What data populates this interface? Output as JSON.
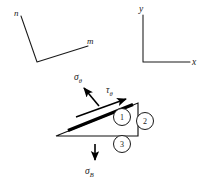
{
  "figure": {
    "background_color": "#ffffff",
    "line_color": "#1a1a1a",
    "width": 202,
    "height": 180
  },
  "angle_marker": {
    "name": "n-m angle marker",
    "label_n": "n",
    "label_m": "m",
    "vertices": [
      {
        "x": 21,
        "y": 16
      },
      {
        "x": 37,
        "y": 62
      },
      {
        "x": 88,
        "y": 46
      }
    ],
    "label_n_pos": {
      "x": 14,
      "y": 14
    },
    "label_m_pos": {
      "x": 88,
      "y": 44
    }
  },
  "axes": {
    "name": "xy coordinate axes",
    "label_y": "y",
    "label_x": "x",
    "origin": {
      "x": 143,
      "y": 62
    },
    "y_top": {
      "x": 143,
      "y": 15
    },
    "x_right": {
      "x": 190,
      "y": 62
    },
    "label_y_pos": {
      "x": 140,
      "y": 12
    },
    "label_x_pos": {
      "x": 193,
      "y": 65
    }
  },
  "wedge": {
    "name": "triangular wedge element",
    "apex_left": {
      "x": 56,
      "y": 136
    },
    "top_right": {
      "x": 138,
      "y": 103
    },
    "bottom_right": {
      "x": 138,
      "y": 136
    },
    "bold_face": {
      "x1": 68,
      "y1": 130,
      "x2": 133,
      "y2": 105
    }
  },
  "stresses": {
    "sigma_theta": {
      "symbol": "σ",
      "subscript": "θ",
      "label": "σθ",
      "label_pos": {
        "x": 78,
        "y": 78
      },
      "arrow_from": {
        "x": 99,
        "y": 105
      },
      "arrow_to": {
        "x": 83,
        "y": 86
      }
    },
    "tau_theta": {
      "symbol": "τ",
      "subscript": "θ",
      "label": "τθ",
      "label_pos": {
        "x": 110,
        "y": 93
      },
      "arrow_from": {
        "x": 75,
        "y": 117
      },
      "arrow_to": {
        "x": 127,
        "y": 98
      }
    },
    "sigma_B": {
      "symbol": "σ",
      "subscript": "B",
      "label": "σB",
      "label_pos": {
        "x": 89,
        "y": 173
      },
      "arrow_from": {
        "x": 95,
        "y": 143
      },
      "arrow_to": {
        "x": 95,
        "y": 161
      }
    }
  },
  "face_markers": [
    {
      "id": "1",
      "name": "face-marker-1",
      "label": "1",
      "cx": 122,
      "cy": 117,
      "r": 8.5
    },
    {
      "id": "2",
      "name": "face-marker-2",
      "label": "2",
      "cx": 145,
      "cy": 121,
      "r": 8.5
    },
    {
      "id": "3",
      "name": "face-marker-3",
      "label": "3",
      "cx": 122,
      "cy": 144,
      "r": 8.5
    }
  ]
}
